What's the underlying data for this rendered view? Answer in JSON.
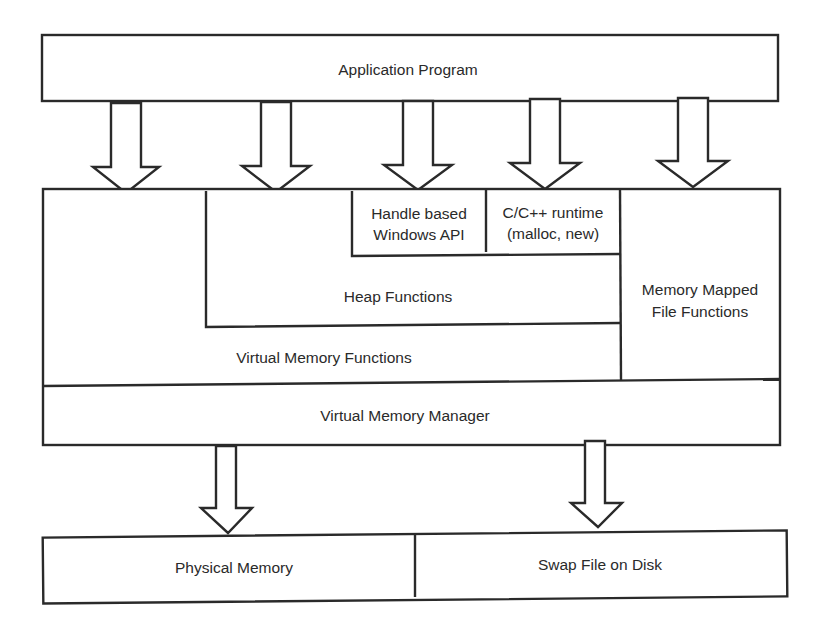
{
  "diagram": {
    "nodes": {
      "application_program": "Application Program",
      "handle_based_api": [
        "Handle based",
        "Windows API"
      ],
      "c_runtime": [
        "C/C++ runtime",
        "(malloc, new)"
      ],
      "heap_functions": "Heap Functions",
      "memory_mapped": [
        "Memory Mapped",
        "File Functions"
      ],
      "virtual_memory_functions": "Virtual Memory Functions",
      "virtual_memory_manager": "Virtual Memory Manager",
      "physical_memory": "Physical Memory",
      "swap_file": "Swap File on Disk"
    },
    "edges": [
      {
        "from": "Application Program",
        "to": "Virtual Memory Functions"
      },
      {
        "from": "Application Program",
        "to": "Heap Functions"
      },
      {
        "from": "Application Program",
        "to": "Handle based Windows API"
      },
      {
        "from": "Application Program",
        "to": "C/C++ runtime (malloc, new)"
      },
      {
        "from": "Application Program",
        "to": "Memory Mapped File Functions"
      },
      {
        "from": "Virtual Memory Manager",
        "to": "Physical Memory"
      },
      {
        "from": "Virtual Memory Manager",
        "to": "Swap File on Disk"
      }
    ],
    "colors": {
      "stroke": "#2a2a2a",
      "background": "#ffffff"
    }
  }
}
